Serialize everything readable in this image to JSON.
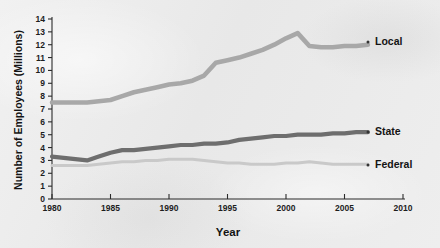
{
  "chart_data": {
    "type": "line",
    "title": "",
    "xlabel": "Year",
    "ylabel": "Number of Employees (Millions)",
    "xlim": [
      1980,
      2010
    ],
    "ylim": [
      0,
      14
    ],
    "xticks": [
      "1980",
      "1985",
      "1990",
      "1995",
      "2000",
      "2005",
      "2010"
    ],
    "yticks": [
      "0",
      "1",
      "2",
      "3",
      "4",
      "5",
      "6",
      "7",
      "8",
      "9",
      "10",
      "11",
      "12",
      "13",
      "14"
    ],
    "grid": false,
    "legend_position": "right-inline-labels",
    "series": [
      {
        "name": "Local",
        "color": "#a8a8a8",
        "label": "Local",
        "x": [
          1980,
          1981,
          1982,
          1983,
          1984,
          1985,
          1986,
          1987,
          1988,
          1989,
          1990,
          1991,
          1992,
          1993,
          1994,
          1995,
          1996,
          1997,
          1998,
          1999,
          2000,
          2001,
          2002,
          2003,
          2004,
          2005,
          2006,
          2007
        ],
        "values": [
          7.5,
          7.5,
          7.5,
          7.5,
          7.6,
          7.7,
          8.0,
          8.3,
          8.5,
          8.7,
          8.9,
          9.0,
          9.2,
          9.6,
          10.6,
          10.8,
          11.0,
          11.3,
          11.6,
          12.0,
          12.5,
          12.9,
          11.9,
          11.8,
          11.8,
          11.9,
          11.9,
          12.0
        ]
      },
      {
        "name": "State",
        "color": "#6e6e6e",
        "label": "State",
        "x": [
          1980,
          1981,
          1982,
          1983,
          1984,
          1985,
          1986,
          1987,
          1988,
          1989,
          1990,
          1991,
          1992,
          1993,
          1994,
          1995,
          1996,
          1997,
          1998,
          1999,
          2000,
          2001,
          2002,
          2003,
          2004,
          2005,
          2006,
          2007
        ],
        "values": [
          3.3,
          3.2,
          3.1,
          3.0,
          3.3,
          3.6,
          3.8,
          3.8,
          3.9,
          4.0,
          4.1,
          4.2,
          4.2,
          4.3,
          4.3,
          4.4,
          4.6,
          4.7,
          4.8,
          4.9,
          4.9,
          5.0,
          5.0,
          5.0,
          5.1,
          5.1,
          5.2,
          5.2
        ]
      },
      {
        "name": "Federal",
        "color": "#c9c9c9",
        "label": "Federal",
        "x": [
          1980,
          1981,
          1982,
          1983,
          1984,
          1985,
          1986,
          1987,
          1988,
          1989,
          1990,
          1991,
          1992,
          1993,
          1994,
          1995,
          1996,
          1997,
          1998,
          1999,
          2000,
          2001,
          2002,
          2003,
          2004,
          2005,
          2006,
          2007
        ],
        "values": [
          2.6,
          2.6,
          2.6,
          2.6,
          2.7,
          2.8,
          2.9,
          2.9,
          3.0,
          3.0,
          3.1,
          3.1,
          3.1,
          3.0,
          2.9,
          2.8,
          2.8,
          2.7,
          2.7,
          2.7,
          2.8,
          2.8,
          2.9,
          2.8,
          2.7,
          2.7,
          2.7,
          2.7
        ]
      }
    ]
  },
  "axes": {
    "y_axis_title": "Number of Employees (Millions)",
    "x_axis_title": "Year"
  },
  "labels": {
    "local": "Local",
    "state": "State",
    "federal": "Federal"
  },
  "colors": {
    "local": "#a8a8a8",
    "state": "#6e6e6e",
    "federal": "#c9c9c9",
    "axis": "#2b2b2b",
    "background": "#ececec"
  }
}
